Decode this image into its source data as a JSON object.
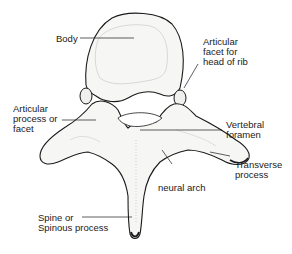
{
  "diagram": {
    "labels": [
      {
        "id": "body",
        "text": "Body"
      },
      {
        "id": "rib-facet",
        "text": "Articular\nfacet for\nhead of rib"
      },
      {
        "id": "articular-process",
        "text": "Articular\nprocess or\nfacet"
      },
      {
        "id": "vertebral-foramen",
        "text": "Vertebral\nforamen"
      },
      {
        "id": "transverse-process",
        "text": "Transverse\nprocess"
      },
      {
        "id": "neural-arch",
        "text": "neural arch"
      },
      {
        "id": "spinous-process",
        "text": "Spine or\nSpinous process"
      }
    ],
    "colors": {
      "ink": "#1a1a1a",
      "bone_fill": "#f6f6f4",
      "shade": "#cfcfcf",
      "background": "#ffffff"
    }
  }
}
